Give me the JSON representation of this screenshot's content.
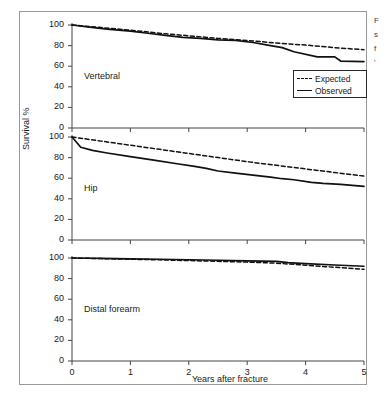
{
  "figure": {
    "caption_fragment_lines": [
      "F",
      "s",
      "f",
      "'"
    ]
  },
  "legend": {
    "position": "inside-top-right-panel1",
    "entries": [
      {
        "label": "Expected",
        "style": "dashed"
      },
      {
        "label": "Observed",
        "style": "solid"
      }
    ]
  },
  "axes": {
    "ylabel": "Survival %",
    "xlabel": "Years after fracture",
    "yticks": [
      "0",
      "20",
      "40",
      "60",
      "80",
      "100"
    ],
    "xticks": [
      "0",
      "1",
      "2",
      "3",
      "4",
      "5"
    ]
  },
  "chart_data": {
    "type": "line",
    "title": "",
    "xlabel": "Years after fracture",
    "ylabel": "Survival %",
    "xlim": [
      0,
      5
    ],
    "ylim": [
      0,
      100
    ],
    "grid": false,
    "legend_position": "upper right of first panel",
    "panels": [
      {
        "name": "Vertebral",
        "label": "Vertebral",
        "series": [
          {
            "name": "Expected",
            "style": "dashed",
            "x": [
              0,
              0.5,
              1,
              1.5,
              2,
              2.5,
              3,
              3.5,
              4,
              4.5,
              5
            ],
            "values": [
              100,
              97.5,
              95,
              92,
              89.5,
              87,
              85,
              82.5,
              80.5,
              78,
              76
            ]
          },
          {
            "name": "Observed",
            "style": "solid",
            "x": [
              0,
              0.3,
              0.6,
              1.0,
              1.3,
              1.6,
              1.9,
              2.2,
              2.5,
              2.8,
              3.1,
              3.4,
              3.6,
              3.8,
              4.2,
              4.5,
              4.6,
              5.0
            ],
            "values": [
              100,
              98,
              96,
              94,
              92,
              90,
              88,
              87,
              85.5,
              85,
              83,
              80,
              78,
              74,
              69,
              69,
              65,
              64.5
            ]
          }
        ]
      },
      {
        "name": "Hip",
        "label": "Hip",
        "series": [
          {
            "name": "Expected",
            "style": "dashed",
            "x": [
              0,
              0.5,
              1,
              1.5,
              2,
              2.5,
              3,
              3.5,
              4,
              4.5,
              5
            ],
            "values": [
              100,
              96,
              92,
              88,
              84,
              80,
              76,
              72.5,
              69,
              65.5,
              62
            ]
          },
          {
            "name": "Observed",
            "style": "solid",
            "x": [
              0,
              0.15,
              0.35,
              0.6,
              1.0,
              1.4,
              1.8,
              2.1,
              2.3,
              2.5,
              2.8,
              3.1,
              3.4,
              3.6,
              3.8,
              4.1,
              4.3,
              4.6,
              5.0
            ],
            "values": [
              100,
              90,
              87,
              84.5,
              81,
              77.5,
              74,
              71.5,
              69.5,
              67,
              65,
              63,
              61,
              59.5,
              58.5,
              56,
              55,
              54,
              52
            ]
          }
        ]
      },
      {
        "name": "Distal forearm",
        "label": "Distal forearm",
        "series": [
          {
            "name": "Expected",
            "style": "dashed",
            "x": [
              0,
              0.5,
              1,
              1.5,
              2,
              2.5,
              3,
              3.5,
              4,
              4.5,
              5
            ],
            "values": [
              100,
              99.4,
              98.8,
              98.2,
              97.5,
              96.8,
              96,
              95,
              93,
              91,
              89
            ]
          },
          {
            "name": "Observed",
            "style": "solid",
            "x": [
              0,
              0.5,
              1,
              1.5,
              2,
              2.5,
              3,
              3.5,
              3.7,
              4,
              4.5,
              5
            ],
            "values": [
              100,
              99.6,
              99.2,
              98.8,
              98.3,
              97.8,
              97.2,
              96.8,
              95.5,
              94.5,
              93.2,
              92
            ]
          }
        ]
      }
    ]
  },
  "colors": {
    "line": "#111111",
    "axis": "#444444",
    "frame": "#9a9a9a",
    "background": "#ffffff"
  }
}
